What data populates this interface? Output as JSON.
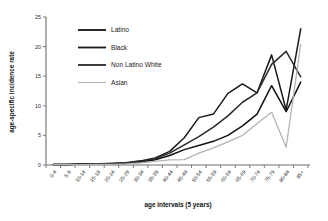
{
  "chart_data": {
    "type": "line",
    "title": "",
    "xlabel": "age intervals (5 years)",
    "ylabel": "age-specific incidence rate",
    "ylim": [
      0,
      25
    ],
    "yticks": [
      0,
      5,
      10,
      15,
      20,
      25
    ],
    "grid": false,
    "legend_position": "upper-left",
    "categories": [
      "0-4",
      "5-9",
      "10-14",
      "15-19",
      "20-24",
      "25-29",
      "30-34",
      "35-39",
      "40-44",
      "45-49",
      "50-54",
      "55-59",
      "60-64",
      "65-69",
      "70-74",
      "75-79",
      "80-84",
      "85+"
    ],
    "series": [
      {
        "name": "Latino",
        "color": "#111111",
        "width": 1.5,
        "values": [
          0.1,
          0.1,
          0.15,
          0.15,
          0.2,
          0.3,
          0.5,
          0.9,
          1.6,
          2.6,
          3.3,
          4.0,
          5.0,
          6.6,
          8.6,
          13.4,
          9.0,
          14.0
        ]
      },
      {
        "name": "Black",
        "color": "#1a1a1a",
        "width": 1.5,
        "values": [
          0.1,
          0.1,
          0.15,
          0.15,
          0.25,
          0.4,
          0.7,
          1.2,
          2.3,
          4.6,
          8.0,
          8.6,
          12.1,
          13.7,
          12.2,
          18.6,
          9.3,
          23.0
        ]
      },
      {
        "name": "Non Latino White",
        "color": "#2a2a2a",
        "width": 1.5,
        "values": [
          0.1,
          0.1,
          0.15,
          0.2,
          0.25,
          0.35,
          0.6,
          1.1,
          2.0,
          3.4,
          4.8,
          6.4,
          8.3,
          10.6,
          12.2,
          17.0,
          19.2,
          14.9
        ]
      },
      {
        "name": "Asian",
        "color": "#b4b4b4",
        "width": 1.3,
        "values": [
          0.05,
          0.05,
          0.08,
          0.1,
          0.12,
          0.2,
          0.35,
          0.6,
          0.85,
          0.9,
          2.0,
          2.9,
          3.9,
          5.0,
          7.0,
          8.9,
          3.0,
          20.4
        ]
      }
    ]
  },
  "legend": {
    "items": [
      {
        "label": "Latino"
      },
      {
        "label": "Black"
      },
      {
        "label": "Non Latino White"
      },
      {
        "label": "Asian"
      }
    ]
  }
}
